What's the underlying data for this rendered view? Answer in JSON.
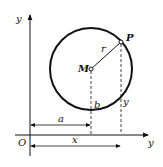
{
  "diagram": {
    "labels": {
      "y_axis": "y",
      "x_axis": "y",
      "origin": "O",
      "center": "M",
      "point": "P",
      "radius": "r",
      "offset_a": "a",
      "offset_b": "b",
      "coord_x": "x",
      "coord_y": "y"
    },
    "colors": {
      "stroke": "#111111",
      "background": "#ffffff"
    }
  }
}
